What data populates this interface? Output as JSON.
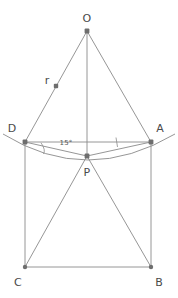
{
  "figure": {
    "type": "geometry-diagram",
    "stroke_color": "#8a8a8a",
    "vertex_color": "#6e6e6e",
    "label_color": "#4a4a4a",
    "background_color": "#ffffff",
    "stroke_width": 0.9
  },
  "vertices": [
    {
      "id": "O",
      "label": "O",
      "x": 87,
      "y": 31,
      "label_x": 87,
      "label_y": 18
    },
    {
      "id": "D",
      "label": "D",
      "x": 25,
      "y": 142,
      "label_x": 12,
      "label_y": 128
    },
    {
      "id": "A",
      "label": "A",
      "x": 151,
      "y": 142,
      "label_x": 160,
      "label_y": 128
    },
    {
      "id": "P",
      "label": "P",
      "x": 87,
      "y": 156,
      "label_x": 87,
      "label_y": 172
    },
    {
      "id": "C",
      "label": "C",
      "x": 25,
      "y": 267,
      "label_x": 18,
      "label_y": 282
    },
    {
      "id": "B",
      "label": "B",
      "x": 151,
      "y": 267,
      "label_x": 159,
      "label_y": 282
    }
  ],
  "radius_marker": {
    "label": "r",
    "label_x": 47,
    "label_y": 80,
    "dot_x": 56,
    "dot_y": 86
  },
  "angle_marker": {
    "label": "15°",
    "label_x": 66,
    "label_y": 143,
    "vertex": "D"
  },
  "edges": [
    {
      "name": "O-D",
      "from": "O",
      "to": "D"
    },
    {
      "name": "O-A",
      "from": "O",
      "to": "A"
    },
    {
      "name": "O-P",
      "from": "O",
      "to": "P"
    },
    {
      "name": "D-A",
      "from": "D",
      "to": "A"
    },
    {
      "name": "D-P",
      "from": "D",
      "to": "P"
    },
    {
      "name": "P-A",
      "from": "P",
      "to": "A"
    },
    {
      "name": "D-C",
      "from": "D",
      "to": "C"
    },
    {
      "name": "A-B",
      "from": "A",
      "to": "B"
    },
    {
      "name": "C-B",
      "from": "C",
      "to": "B"
    },
    {
      "name": "P-C",
      "from": "P",
      "to": "C"
    },
    {
      "name": "P-B",
      "from": "P",
      "to": "B"
    }
  ],
  "arc": {
    "name": "circular-arc-through-P",
    "path": "M 3 134 Q 87 186 175 134",
    "note": "arc passing through D, P and A extended slightly beyond D and A"
  },
  "angle_arc_path": "M 40 143 Q 46 150 44 154",
  "tick_marks": [
    {
      "name": "angle-tick-at-A",
      "x1": 116,
      "y1": 138,
      "x2": 117,
      "y2": 147
    }
  ]
}
